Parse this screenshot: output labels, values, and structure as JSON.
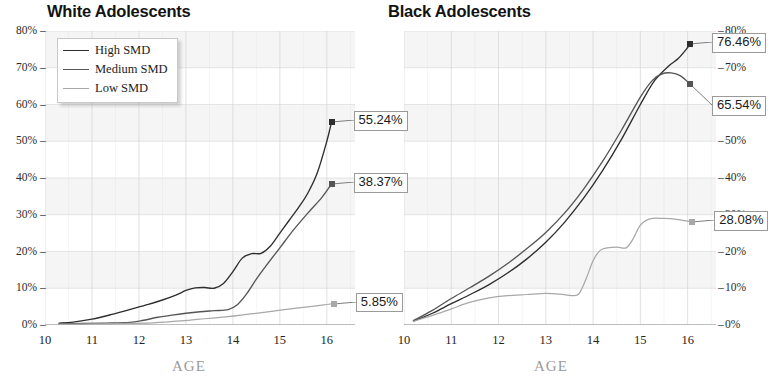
{
  "chart_data": [
    {
      "type": "line",
      "title": "White Adolescents",
      "xlabel": "AGE",
      "ylabel": "",
      "xlim": [
        10,
        16.6
      ],
      "ylim": [
        0,
        80
      ],
      "grid": true,
      "legend_position": "top-left",
      "xticks": [
        10,
        11,
        12,
        13,
        14,
        15,
        16
      ],
      "xtick_labels": [
        "10",
        "11",
        "12",
        "13",
        "14",
        "15",
        "16"
      ],
      "yticks": [
        0,
        10,
        20,
        30,
        40,
        50,
        60,
        70,
        80
      ],
      "ytick_labels": [
        "0%",
        "10%",
        "20%",
        "30%",
        "40%",
        "50%",
        "60%",
        "70%",
        "80%"
      ],
      "series": [
        {
          "name": "High SMD",
          "color": "#2e2e2e",
          "end_label": "55.24%",
          "end_value": 55.24,
          "x": [
            10.3,
            10.6,
            11.0,
            11.4,
            11.8,
            12.2,
            12.5,
            12.8,
            13.0,
            13.2,
            13.4,
            13.6,
            13.8,
            14.0,
            14.2,
            14.4,
            14.6,
            14.8,
            15.0,
            15.2,
            15.4,
            15.6,
            15.8,
            16.0,
            16.1
          ],
          "y": [
            0.5,
            0.8,
            1.6,
            2.8,
            4.2,
            5.6,
            6.8,
            8.2,
            9.4,
            10.1,
            10.2,
            10.0,
            11.3,
            14.5,
            18.2,
            19.4,
            19.5,
            21.5,
            25.0,
            28.5,
            32.0,
            36.0,
            41.5,
            50.0,
            55.24
          ]
        },
        {
          "name": "Medium SMD",
          "color": "#555555",
          "end_label": "38.37%",
          "end_value": 38.37,
          "x": [
            10.3,
            10.8,
            11.3,
            11.8,
            12.1,
            12.4,
            12.7,
            13.0,
            13.3,
            13.6,
            13.9,
            14.1,
            14.3,
            14.5,
            14.7,
            15.0,
            15.3,
            15.6,
            15.9,
            16.1
          ],
          "y": [
            0.3,
            0.4,
            0.5,
            0.7,
            1.3,
            2.1,
            2.7,
            3.2,
            3.6,
            3.9,
            4.2,
            5.6,
            8.6,
            12.5,
            16.0,
            21.0,
            26.0,
            30.5,
            34.8,
            38.37
          ]
        },
        {
          "name": "Low SMD",
          "color": "#a8a8a8",
          "end_label": "5.85%",
          "end_value": 5.85,
          "x": [
            10.3,
            11.0,
            11.7,
            12.3,
            12.9,
            13.4,
            13.9,
            14.3,
            14.7,
            15.1,
            15.5,
            15.9,
            16.15
          ],
          "y": [
            0.2,
            0.3,
            0.4,
            0.6,
            1.1,
            1.7,
            2.3,
            2.9,
            3.5,
            4.2,
            4.8,
            5.4,
            5.85
          ]
        }
      ]
    },
    {
      "type": "line",
      "title": "Black Adolescents",
      "xlabel": "AGE",
      "ylabel": "",
      "xlim": [
        10,
        16.6
      ],
      "ylim": [
        0,
        80
      ],
      "grid": true,
      "legend_position": "none",
      "xticks": [
        10,
        11,
        12,
        13,
        14,
        15,
        16
      ],
      "xtick_labels": [
        "10",
        "11",
        "12",
        "13",
        "14",
        "15",
        "16"
      ],
      "yticks": [
        0,
        10,
        20,
        30,
        40,
        50,
        60,
        70,
        80
      ],
      "ytick_labels": [
        "0%",
        "10%",
        "20%",
        "30%",
        "40%",
        "50%",
        "60%",
        "70%",
        "80%"
      ],
      "series": [
        {
          "name": "High SMD",
          "color": "#2e2e2e",
          "end_label": "76.46%",
          "end_value": 76.46,
          "x": [
            10.2,
            10.6,
            11.0,
            11.4,
            11.8,
            12.2,
            12.6,
            13.0,
            13.4,
            13.8,
            14.2,
            14.6,
            15.0,
            15.3,
            15.6,
            15.8,
            16.0,
            16.05
          ],
          "y": [
            1.0,
            3.2,
            5.8,
            8.3,
            11.0,
            14.2,
            18.0,
            22.5,
            28.0,
            34.5,
            42.0,
            50.5,
            60.0,
            66.5,
            70.5,
            72.5,
            75.5,
            76.46
          ]
        },
        {
          "name": "Medium SMD",
          "color": "#555555",
          "end_label": "65.54%",
          "end_value": 65.54,
          "x": [
            10.2,
            10.6,
            11.0,
            11.4,
            11.8,
            12.2,
            12.6,
            13.0,
            13.4,
            13.8,
            14.2,
            14.6,
            15.0,
            15.25,
            15.45,
            15.65,
            15.85,
            16.05
          ],
          "y": [
            1.2,
            4.0,
            7.2,
            10.2,
            13.3,
            16.8,
            20.8,
            25.2,
            30.5,
            37.0,
            44.5,
            53.0,
            62.0,
            66.5,
            68.3,
            68.6,
            67.8,
            65.54
          ]
        },
        {
          "name": "Low SMD",
          "color": "#a8a8a8",
          "end_label": "28.08%",
          "end_value": 28.08,
          "x": [
            10.2,
            10.6,
            11.0,
            11.4,
            11.8,
            12.2,
            12.6,
            13.0,
            13.3,
            13.55,
            13.7,
            13.85,
            14.0,
            14.15,
            14.3,
            14.5,
            14.7,
            14.85,
            15.0,
            15.2,
            15.5,
            15.8,
            16.1
          ],
          "y": [
            1.0,
            2.6,
            4.4,
            6.2,
            7.4,
            8.0,
            8.3,
            8.6,
            8.4,
            8.0,
            8.5,
            12.5,
            17.5,
            20.3,
            21.0,
            21.2,
            21.0,
            23.5,
            27.2,
            28.9,
            29.0,
            28.7,
            28.08
          ]
        }
      ]
    }
  ],
  "legend": {
    "items": [
      {
        "label": "High SMD",
        "color": "#2e2e2e"
      },
      {
        "label": "Medium SMD",
        "color": "#555555"
      },
      {
        "label": "Low SMD",
        "color": "#a8a8a8"
      }
    ]
  },
  "axis": {
    "x_title": "AGE",
    "ytick_labels": [
      "80%",
      "70%",
      "60%",
      "50%",
      "40%",
      "30%",
      "20%",
      "10%",
      "0%"
    ],
    "xtick_labels": [
      "10",
      "11",
      "12",
      "13",
      "14",
      "15",
      "16"
    ]
  },
  "callouts": {
    "white": [
      "55.24%",
      "38.37%",
      "5.85%"
    ],
    "black": [
      "76.46%",
      "65.54%",
      "28.08%"
    ]
  },
  "titles": {
    "white": "White Adolescents",
    "black": "Black Adolescents"
  },
  "colors": {
    "high": "#2e2e2e",
    "medium": "#555555",
    "low": "#a8a8a8",
    "band": "#ececec",
    "grid": "#d6d6d6",
    "axis_title": "#9b9b9b"
  }
}
